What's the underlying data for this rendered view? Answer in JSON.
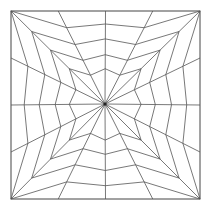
{
  "diagram": {
    "kind": "square spiderweb line pattern",
    "colors": {
      "background": "#ffffff",
      "line": "#555555",
      "frame": "#444444",
      "hub": "#222222"
    },
    "frame": {
      "x1": 11,
      "y1": 11,
      "x2": 200,
      "y2": 199
    },
    "center": {
      "x": 105,
      "y": 104
    },
    "spoke_count": 16,
    "ring_count": 4,
    "ring_fractions": {
      "diagonal": [
        1.0,
        0.78,
        0.58,
        0.38
      ],
      "quarter": [
        0.82,
        0.64,
        0.47,
        0.31
      ],
      "middle": [
        0.86,
        0.7,
        0.53,
        0.38
      ]
    }
  }
}
